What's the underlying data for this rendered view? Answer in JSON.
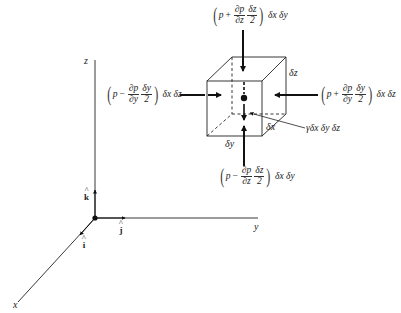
{
  "figure": {
    "axes": {
      "x_label": "x",
      "y_label": "y",
      "z_label": "z",
      "unit_vectors": {
        "i": "i",
        "j": "j",
        "k": "k",
        "hat": "^"
      }
    },
    "cube": {
      "dz_label": "δz",
      "dx_label": "δx",
      "dy_label": "δy"
    },
    "forces": {
      "top": {
        "p": "p",
        "sign": "+",
        "num": "∂p",
        "den": "∂z",
        "half_num": "δz",
        "half_den": "2",
        "tail": "δx δy"
      },
      "bottom": {
        "p": "p",
        "sign": "−",
        "num": "∂p",
        "den": "∂z",
        "half_num": "δz",
        "half_den": "2",
        "tail": "δx δy"
      },
      "left": {
        "p": "p",
        "sign": "−",
        "num": "∂p",
        "den": "∂y",
        "half_num": "δy",
        "half_den": "2",
        "tail": "δx δz"
      },
      "right": {
        "p": "p",
        "sign": "+",
        "num": "∂p",
        "den": "∂y",
        "half_num": "δy",
        "half_den": "2",
        "tail": "δx δz"
      },
      "weight": "γδx δy δz"
    },
    "colors": {
      "line": "#111111",
      "background": "#ffffff"
    }
  }
}
